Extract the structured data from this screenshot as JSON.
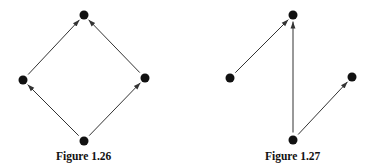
{
  "figures": [
    {
      "caption": "Figure 1.26",
      "nodes": [
        {
          "id": "top",
          "x": 84,
          "y": 15
        },
        {
          "id": "left",
          "x": 23,
          "y": 80
        },
        {
          "id": "right",
          "x": 145,
          "y": 78
        },
        {
          "id": "bottom",
          "x": 84,
          "y": 141
        }
      ],
      "edges": [
        {
          "from": "left",
          "to": "top"
        },
        {
          "from": "right",
          "to": "top"
        },
        {
          "from": "bottom",
          "to": "left"
        },
        {
          "from": "bottom",
          "to": "right"
        }
      ]
    },
    {
      "caption": "Figure 1.27",
      "nodes": [
        {
          "id": "top",
          "x": 293,
          "y": 15
        },
        {
          "id": "left",
          "x": 230,
          "y": 78
        },
        {
          "id": "right",
          "x": 352,
          "y": 77
        },
        {
          "id": "bottom",
          "x": 293,
          "y": 140
        }
      ],
      "edges": [
        {
          "from": "left",
          "to": "top"
        },
        {
          "from": "bottom",
          "to": "top"
        },
        {
          "from": "bottom",
          "to": "right"
        }
      ]
    }
  ],
  "style": {
    "node_color": "#111111",
    "edge_color": "#333333",
    "node_radius": 4.5
  }
}
